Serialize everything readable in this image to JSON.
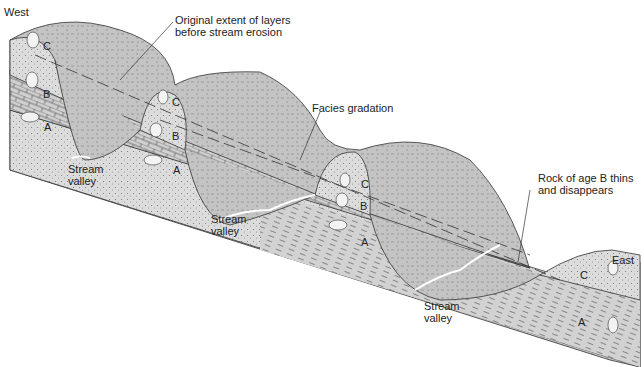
{
  "figure": {
    "type": "geologic block diagram"
  },
  "directions": {
    "west": "West",
    "east": "East"
  },
  "labels": {
    "original_extent": "Original extent of layers\nbefore stream erosion",
    "facies_gradation": "Facies gradation",
    "rock_b_thins": "Rock of age B thins\nand disappears",
    "stream_valley_1": "Stream\nvalley",
    "stream_valley_2": "Stream\nvalley",
    "stream_valley_3": "Stream\nvalley"
  },
  "layers": {
    "a": "A",
    "b": "B",
    "c": "C"
  },
  "layer_letters": [
    {
      "id": "c1",
      "text": "C"
    },
    {
      "id": "b1",
      "text": "B"
    },
    {
      "id": "a1",
      "text": "A"
    },
    {
      "id": "c2",
      "text": "C"
    },
    {
      "id": "b2",
      "text": "B"
    },
    {
      "id": "a2",
      "text": "A"
    },
    {
      "id": "c3",
      "text": "C"
    },
    {
      "id": "b3",
      "text": "B"
    },
    {
      "id": "a3",
      "text": "A"
    },
    {
      "id": "c4",
      "text": "C"
    },
    {
      "id": "a4",
      "text": "A"
    }
  ],
  "colors": {
    "land": "#c9c9c9",
    "sandstone": "#dcdcdc",
    "limestone": "#cfcfcf",
    "shale": "#d4d4d4",
    "line": "#333333"
  }
}
